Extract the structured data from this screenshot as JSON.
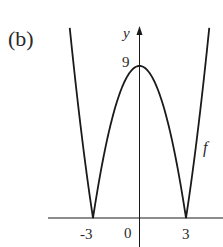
{
  "chart_data": {
    "type": "line",
    "title": "",
    "panel_label": "(b)",
    "xlabel": "",
    "ylabel": "y",
    "function_label": "f",
    "function": "f(x) = |9 - x^2|",
    "x_ticks": [
      "-3",
      "0",
      "3"
    ],
    "y_ticks": [
      "9"
    ],
    "series": [
      {
        "name": "f",
        "x": [
          -4.5,
          -4,
          -3.5,
          -3,
          -2.5,
          -2,
          -1.5,
          -1,
          -0.5,
          0,
          0.5,
          1,
          1.5,
          2,
          2.5,
          3,
          3.5,
          4,
          4.5
        ],
        "values": [
          11.25,
          7,
          3.25,
          0,
          2.75,
          5,
          6.75,
          8,
          8.75,
          9,
          8.75,
          8,
          6.75,
          5,
          2.75,
          0,
          3.25,
          7,
          11.25
        ]
      }
    ],
    "xlim": [
      -6,
      5.5
    ],
    "ylim": [
      -1.7,
      11.25
    ],
    "grid": false,
    "legend": "none",
    "colors": {
      "curve": "#1a1a1a",
      "axes": "#1a1a1a",
      "background": "#ffffff"
    }
  }
}
